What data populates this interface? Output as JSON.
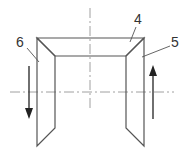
{
  "diagram": {
    "labels": [
      {
        "id": "part-4",
        "text": "4"
      },
      {
        "id": "part-5",
        "text": "5"
      },
      {
        "id": "part-6",
        "text": "6"
      }
    ],
    "arrows": [
      {
        "id": "left-arrow",
        "direction": "down"
      },
      {
        "id": "right-arrow",
        "direction": "up"
      }
    ],
    "colors": {
      "line": "#555555",
      "centerline": "#888888",
      "arrow": "#222222"
    }
  }
}
